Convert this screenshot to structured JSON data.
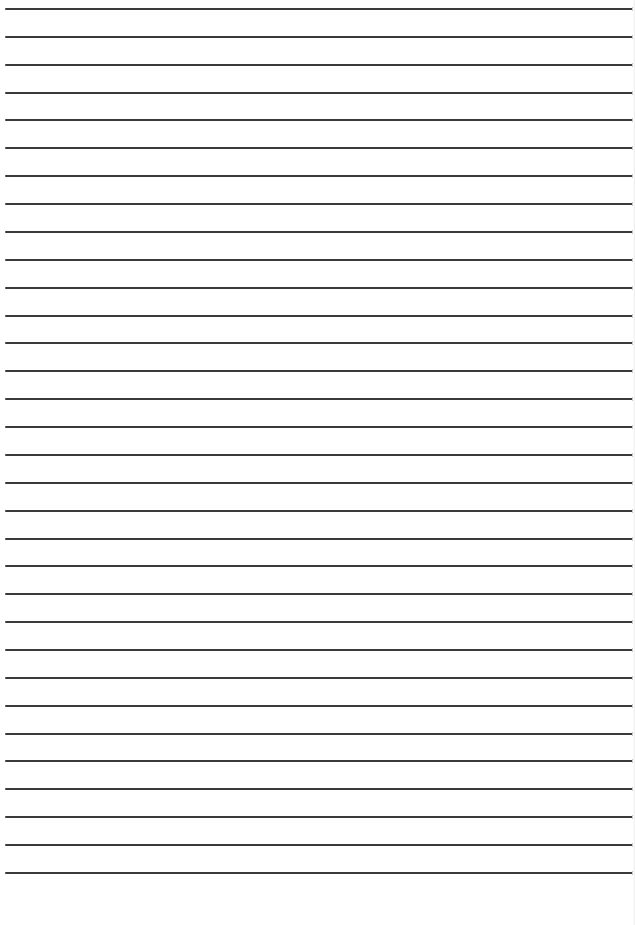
{
  "document": {
    "type": "lined-paper",
    "background_color": "#ffffff",
    "line_color": "#3a3a3a",
    "line_count": 32,
    "first_line_y": 8,
    "line_spacing": 27.87,
    "line_left_x": 5,
    "text_content": ""
  }
}
